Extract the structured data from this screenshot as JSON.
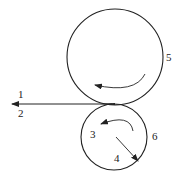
{
  "diagram": {
    "type": "roller-pair",
    "colors": {
      "stroke": "#222222",
      "background": "#ffffff"
    },
    "labels": {
      "l1": "1",
      "l2": "2",
      "l3": "3",
      "l4": "4",
      "l5": "5",
      "l6": "6"
    },
    "upper_roller": {
      "cx": 115,
      "cy": 57,
      "r": 48,
      "label": "5"
    },
    "lower_roller": {
      "cx": 114,
      "cy": 137,
      "r": 33,
      "label": "6"
    },
    "output_line": {
      "from_x": 110,
      "to_x": 12,
      "y": 104
    }
  }
}
